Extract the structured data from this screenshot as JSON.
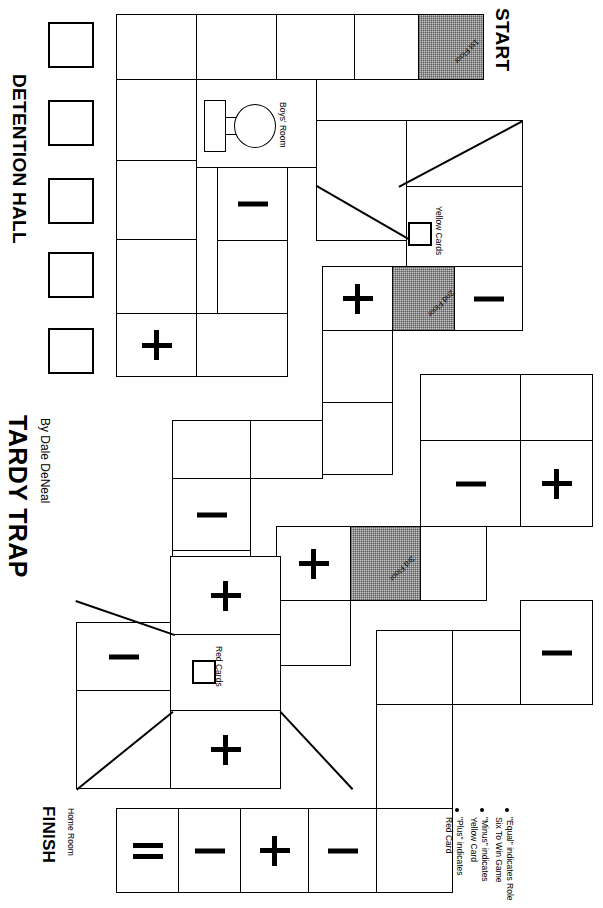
{
  "game": {
    "title": "TARDY TRAP",
    "byline": "By Dale DeNeal",
    "start_label": "START",
    "finish_label": "FINISH",
    "finish_sub": "Home Room",
    "detention_label": "DETENTION HALL"
  },
  "annotations": {
    "boys_room": "Boys' Room",
    "yellow_cards": "Yellow Cards",
    "red_cards": "Red Cards",
    "floor_1": "1st Floor",
    "floor_2": "2nd Floor",
    "floor_3": "3rd Floor"
  },
  "legend": {
    "items": [
      {
        "line1": "\"Plus\" indicates",
        "line2": "Red Card"
      },
      {
        "line1": "\"Minus\" indicates",
        "line2": "Yellow Card"
      },
      {
        "line1": "\"Equal\" indicates Role",
        "line2": "Six To Win Game"
      }
    ]
  },
  "colors": {
    "ink": "#000000",
    "paper": "#ffffff",
    "shaded_space": "#c9c9c9"
  },
  "detention_slots": [
    {
      "id": "detention-slot-1"
    },
    {
      "id": "detention-slot-2"
    },
    {
      "id": "detention-slot-3"
    },
    {
      "id": "detention-slot-4"
    },
    {
      "id": "detention-slot-5"
    }
  ],
  "board": {
    "spaces": [
      {
        "id": "s-start",
        "name": "space-start-1st-floor",
        "x": 418,
        "y": 14,
        "w": 64,
        "h": 64,
        "shaded": true,
        "glyph": "none",
        "floor": "1st Floor"
      },
      {
        "id": "s-top-1",
        "name": "space-top-1",
        "x": 354,
        "y": 14,
        "w": 64,
        "h": 64,
        "shaded": false,
        "glyph": "none"
      },
      {
        "id": "s-top-2",
        "name": "space-top-2",
        "x": 276,
        "y": 14,
        "w": 78,
        "h": 64,
        "shaded": false,
        "glyph": "none"
      },
      {
        "id": "s-top-3",
        "name": "space-top-3",
        "x": 196,
        "y": 14,
        "w": 80,
        "h": 64,
        "shaded": false,
        "glyph": "none"
      },
      {
        "id": "s-top-4",
        "name": "space-top-4",
        "x": 116,
        "y": 14,
        "w": 80,
        "h": 64,
        "shaded": false,
        "glyph": "none"
      },
      {
        "id": "s-l1",
        "name": "space-left-col-1",
        "x": 116,
        "y": 78,
        "w": 80,
        "h": 82,
        "shaded": false,
        "glyph": "none"
      },
      {
        "id": "s-l2",
        "name": "space-left-col-2",
        "x": 116,
        "y": 160,
        "w": 80,
        "h": 80,
        "shaded": false,
        "glyph": "none"
      },
      {
        "id": "s-l3",
        "name": "space-left-col-3",
        "x": 116,
        "y": 240,
        "w": 80,
        "h": 74,
        "shaded": false,
        "glyph": "none"
      },
      {
        "id": "s-l4",
        "name": "space-left-col-4-plus",
        "x": 116,
        "y": 314,
        "w": 80,
        "h": 62,
        "shaded": false,
        "glyph": "plus"
      },
      {
        "id": "s-boys-hall",
        "name": "space-boys-room-hall",
        "x": 196,
        "y": 78,
        "w": 120,
        "h": 88,
        "shaded": false,
        "glyph": "none"
      },
      {
        "id": "s-minus-a",
        "name": "space-minus-a",
        "x": 216,
        "y": 166,
        "w": 72,
        "h": 74,
        "shaded": false,
        "glyph": "minus"
      },
      {
        "id": "s-hall-b",
        "name": "space-hall-b",
        "x": 216,
        "y": 240,
        "w": 72,
        "h": 74,
        "shaded": false,
        "glyph": "none"
      },
      {
        "id": "s-hall-c",
        "name": "space-hall-c",
        "x": 196,
        "y": 314,
        "w": 92,
        "h": 62,
        "shaded": false,
        "glyph": "none"
      },
      {
        "id": "s-yc-room",
        "name": "space-yellow-cards-room",
        "x": 406,
        "y": 186,
        "w": 116,
        "h": 80,
        "shaded": false,
        "glyph": "none"
      },
      {
        "id": "s-diag-room",
        "name": "space-diagonal-room",
        "x": 316,
        "y": 120,
        "w": 90,
        "h": 120,
        "shaded": false,
        "glyph": "none"
      },
      {
        "id": "s-upper-right",
        "name": "space-upper-right",
        "x": 406,
        "y": 120,
        "w": 116,
        "h": 66,
        "shaded": false,
        "glyph": "none"
      },
      {
        "id": "s-2f",
        "name": "space-2nd-floor",
        "x": 392,
        "y": 266,
        "w": 62,
        "h": 64,
        "shaded": true,
        "glyph": "none",
        "floor": "2nd Floor"
      },
      {
        "id": "s-2f-plus",
        "name": "space-2nd-floor-plus",
        "x": 322,
        "y": 266,
        "w": 70,
        "h": 64,
        "shaded": false,
        "glyph": "plus"
      },
      {
        "id": "s-2f-minus",
        "name": "space-2nd-floor-minus",
        "x": 454,
        "y": 266,
        "w": 68,
        "h": 64,
        "shaded": false,
        "glyph": "minus"
      },
      {
        "id": "s-mid-a",
        "name": "space-mid-a",
        "x": 322,
        "y": 330,
        "w": 70,
        "h": 72,
        "shaded": false,
        "glyph": "none"
      },
      {
        "id": "s-mid-b",
        "name": "space-mid-b",
        "x": 322,
        "y": 402,
        "w": 70,
        "h": 72,
        "shaded": false,
        "glyph": "none"
      },
      {
        "id": "s-mid-c",
        "name": "space-mid-c",
        "x": 172,
        "y": 420,
        "w": 78,
        "h": 58,
        "shaded": false,
        "glyph": "none"
      },
      {
        "id": "s-mid-d",
        "name": "space-mid-d",
        "x": 250,
        "y": 420,
        "w": 72,
        "h": 58,
        "shaded": false,
        "glyph": "none"
      },
      {
        "id": "s-mid-e",
        "name": "space-mid-e-minus",
        "x": 172,
        "y": 478,
        "w": 78,
        "h": 72,
        "shaded": false,
        "glyph": "minus"
      },
      {
        "id": "s-mid-f",
        "name": "space-mid-f-plus",
        "x": 172,
        "y": 550,
        "w": 78,
        "h": 72,
        "shaded": false,
        "glyph": "plus"
      },
      {
        "id": "s-3f",
        "name": "space-3rd-floor",
        "x": 350,
        "y": 526,
        "w": 70,
        "h": 74,
        "shaded": true,
        "glyph": "none",
        "floor": "3rd Floor"
      },
      {
        "id": "s-3f-plus",
        "name": "space-3rd-floor-plus",
        "x": 276,
        "y": 526,
        "w": 74,
        "h": 74,
        "shaded": false,
        "glyph": "plus"
      },
      {
        "id": "s-3f-right",
        "name": "space-3rd-floor-right",
        "x": 420,
        "y": 526,
        "w": 66,
        "h": 74,
        "shaded": false,
        "glyph": "none"
      },
      {
        "id": "s-r1",
        "name": "space-right-1",
        "x": 420,
        "y": 374,
        "w": 100,
        "h": 66,
        "shaded": false,
        "glyph": "none"
      },
      {
        "id": "s-r2",
        "name": "space-right-2",
        "x": 520,
        "y": 374,
        "w": 72,
        "h": 66,
        "shaded": false,
        "glyph": "none"
      },
      {
        "id": "s-r3",
        "name": "space-right-3-minus",
        "x": 420,
        "y": 440,
        "w": 100,
        "h": 86,
        "shaded": false,
        "glyph": "minus"
      },
      {
        "id": "s-r4",
        "name": "space-right-4-plus",
        "x": 520,
        "y": 440,
        "w": 72,
        "h": 86,
        "shaded": false,
        "glyph": "plus"
      },
      {
        "id": "s-r5",
        "name": "space-right-5-minus",
        "x": 520,
        "y": 600,
        "w": 72,
        "h": 104,
        "shaded": false,
        "glyph": "minus"
      },
      {
        "id": "s-rb1",
        "name": "space-right-bottom-1",
        "x": 376,
        "y": 630,
        "w": 76,
        "h": 74,
        "shaded": false,
        "glyph": "none"
      },
      {
        "id": "s-rb2",
        "name": "space-right-bottom-2",
        "x": 452,
        "y": 630,
        "w": 68,
        "h": 74,
        "shaded": false,
        "glyph": "none"
      },
      {
        "id": "s-rb3",
        "name": "space-right-bottom-3",
        "x": 376,
        "y": 704,
        "w": 76,
        "h": 104,
        "shaded": false,
        "glyph": "none"
      },
      {
        "id": "s-rb4",
        "name": "space-right-bottom-4",
        "x": 376,
        "y": 808,
        "w": 76,
        "h": 84,
        "shaded": false,
        "glyph": "none"
      },
      {
        "id": "s-rc-room",
        "name": "space-red-cards-room",
        "x": 170,
        "y": 634,
        "w": 110,
        "h": 76,
        "shaded": false,
        "glyph": "none"
      },
      {
        "id": "s-rc-minus",
        "name": "space-red-cards-minus",
        "x": 76,
        "y": 622,
        "w": 94,
        "h": 68,
        "shaded": false,
        "glyph": "minus"
      },
      {
        "id": "s-rc-plus-b",
        "name": "space-red-cards-plus-b",
        "x": 170,
        "y": 710,
        "w": 110,
        "h": 78,
        "shaded": false,
        "glyph": "plus"
      },
      {
        "id": "s-rc-left",
        "name": "space-red-cards-left",
        "x": 76,
        "y": 690,
        "w": 94,
        "h": 98,
        "shaded": false,
        "glyph": "none"
      },
      {
        "id": "s-f1",
        "name": "space-finish-equals",
        "x": 116,
        "y": 808,
        "w": 62,
        "h": 84,
        "shaded": false,
        "glyph": "equals"
      },
      {
        "id": "s-f2",
        "name": "space-finish-minus-1",
        "x": 178,
        "y": 808,
        "w": 62,
        "h": 84,
        "shaded": false,
        "glyph": "minus"
      },
      {
        "id": "s-f3",
        "name": "space-finish-plus",
        "x": 240,
        "y": 808,
        "w": 68,
        "h": 84,
        "shaded": false,
        "glyph": "plus"
      },
      {
        "id": "s-f4",
        "name": "space-finish-minus-2",
        "x": 308,
        "y": 808,
        "w": 68,
        "h": 84,
        "shaded": false,
        "glyph": "minus"
      }
    ]
  }
}
